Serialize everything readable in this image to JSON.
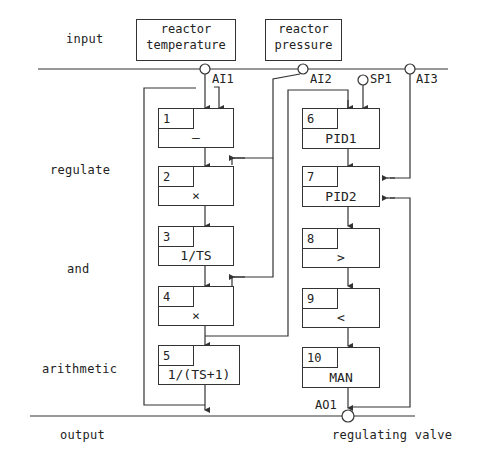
{
  "side_labels": {
    "input": "input",
    "regulate": "regulate",
    "and": "and",
    "arithmetic": "arithmetic",
    "output": "output"
  },
  "sources": {
    "temperature": "reactor\ntemperature",
    "temperature_line1": "reactor",
    "temperature_line2": "temperature",
    "pressure_line1": "reactor",
    "pressure_line2": "pressure"
  },
  "pins": {
    "ai1": "AI1",
    "ai2": "AI2",
    "sp1": "SP1",
    "ai3": "AI3",
    "ao1": "AO1"
  },
  "blocks": [
    {
      "num": "1",
      "fn": "—"
    },
    {
      "num": "2",
      "fn": "×"
    },
    {
      "num": "3",
      "fn": "1/TS"
    },
    {
      "num": "4",
      "fn": "×"
    },
    {
      "num": "5",
      "fn": "1/(TS+1)"
    },
    {
      "num": "6",
      "fn": "PID1"
    },
    {
      "num": "7",
      "fn": "PID2"
    },
    {
      "num": "8",
      "fn": ">"
    },
    {
      "num": "9",
      "fn": "<"
    },
    {
      "num": "10",
      "fn": "MAN"
    }
  ],
  "output_target": "regulating valve",
  "colors": {
    "line": "#333333",
    "background": "#ffffff"
  }
}
